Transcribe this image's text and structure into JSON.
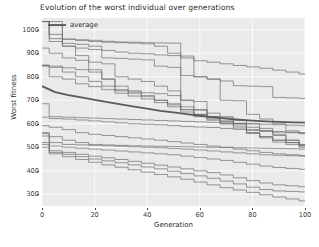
{
  "chart_data": {
    "type": "line",
    "title": "Evolution of the worst individual over generations",
    "xlabel": "Generation",
    "ylabel": "Worst fitness",
    "xlim": [
      0,
      100
    ],
    "ylim": [
      250,
      1050
    ],
    "xticks": [
      0,
      20,
      40,
      60,
      80,
      100
    ],
    "yticks": [
      300,
      400,
      500,
      600,
      700,
      800,
      900,
      1000
    ],
    "grid": true,
    "grid_color": "#ffffff",
    "plot_background": "#eaeaea",
    "legend": {
      "position": "upper left",
      "entries": [
        {
          "name": "average",
          "color": "#5a5a5a",
          "linewidth": 1.8
        }
      ]
    },
    "x": [
      0,
      5,
      10,
      15,
      20,
      25,
      30,
      35,
      40,
      45,
      50,
      55,
      60,
      65,
      70,
      75,
      80,
      85,
      90,
      95,
      100
    ],
    "series": [
      {
        "name": "run-1",
        "color": "#6d6d6d",
        "linewidth": 0.7,
        "values": [
          1035,
          1035,
          960,
          955,
          950,
          947,
          945,
          943,
          940,
          930,
          900,
          880,
          868,
          862,
          855,
          848,
          842,
          836,
          828,
          820,
          812
        ]
      },
      {
        "name": "run-2",
        "color": "#6d6d6d",
        "linewidth": 0.7,
        "values": [
          1035,
          1018,
          960,
          957,
          955,
          951,
          948,
          947,
          945,
          944,
          943,
          888,
          800,
          790,
          782,
          762,
          760,
          758,
          712,
          710,
          708
        ]
      },
      {
        "name": "run-3",
        "color": "#6d6d6d",
        "linewidth": 0.7,
        "values": [
          1035,
          962,
          930,
          922,
          916,
          912,
          905,
          900,
          898,
          893,
          890,
          805,
          800,
          790,
          700,
          698,
          640,
          620,
          600,
          570,
          560
        ]
      },
      {
        "name": "run-4",
        "color": "#6d6d6d",
        "linewidth": 0.7,
        "values": [
          1035,
          950,
          942,
          938,
          930,
          880,
          878,
          875,
          872,
          845,
          840,
          700,
          695,
          630,
          625,
          600,
          575,
          570,
          565,
          562,
          558
        ]
      },
      {
        "name": "run-5",
        "color": "#6d6d6d",
        "linewidth": 0.7,
        "values": [
          922,
          900,
          880,
          870,
          862,
          855,
          800,
          790,
          780,
          760,
          740,
          660,
          640,
          620,
          600,
          590,
          560,
          545,
          530,
          520,
          512
        ]
      },
      {
        "name": "run-6",
        "color": "#6d6d6d",
        "linewidth": 0.7,
        "values": [
          1035,
          980,
          930,
          890,
          830,
          790,
          740,
          735,
          732,
          728,
          720,
          700,
          660,
          630,
          612,
          600,
          560,
          545,
          530,
          520,
          510
        ]
      },
      {
        "name": "run-7",
        "color": "#6d6d6d",
        "linewidth": 0.7,
        "values": [
          850,
          845,
          838,
          830,
          820,
          790,
          760,
          740,
          720,
          700,
          680,
          660,
          640,
          625,
          610,
          600,
          585,
          570,
          550,
          530,
          508
        ]
      },
      {
        "name": "run-8",
        "color": "#6d6d6d",
        "linewidth": 0.7,
        "values": [
          848,
          840,
          820,
          800,
          780,
          760,
          745,
          730,
          715,
          700,
          685,
          672,
          658,
          645,
          630,
          615,
          600,
          580,
          555,
          530,
          505
        ]
      },
      {
        "name": "run-9",
        "color": "#6d6d6d",
        "linewidth": 0.7,
        "values": [
          845,
          800,
          790,
          770,
          758,
          745,
          730,
          718,
          705,
          690,
          672,
          650,
          630,
          615,
          600,
          582,
          562,
          540,
          522,
          512,
          500
        ]
      },
      {
        "name": "average",
        "color": "#5a5a5a",
        "linewidth": 1.8,
        "values": [
          760,
          735,
          722,
          712,
          702,
          692,
          682,
          673,
          664,
          655,
          648,
          641,
          634,
          628,
          622,
          617,
          613,
          610,
          608,
          606,
          605
        ]
      },
      {
        "name": "run-10",
        "color": "#6d6d6d",
        "linewidth": 0.7,
        "values": [
          685,
          630,
          628,
          626,
          624,
          622,
          620,
          618,
          616,
          614,
          612,
          610,
          608,
          606,
          604,
          602,
          600,
          598,
          596,
          594,
          592
        ]
      },
      {
        "name": "run-11",
        "color": "#6d6d6d",
        "linewidth": 0.7,
        "values": [
          628,
          622,
          620,
          616,
          612,
          608,
          604,
          600,
          598,
          596,
          592,
          588,
          586,
          584,
          580,
          576,
          572,
          568,
          566,
          564,
          562
        ]
      },
      {
        "name": "run-12",
        "color": "#6d6d6d",
        "linewidth": 0.7,
        "values": [
          592,
          585,
          575,
          562,
          555,
          550,
          545,
          540,
          535,
          530,
          524,
          518,
          512,
          505,
          500,
          492,
          485,
          478,
          472,
          468,
          465
        ]
      },
      {
        "name": "run-13",
        "color": "#6d6d6d",
        "linewidth": 0.7,
        "values": [
          562,
          545,
          530,
          520,
          512,
          510,
          508,
          506,
          505,
          504,
          503,
          502,
          501,
          500,
          499,
          498,
          497,
          496,
          495,
          494,
          492
        ]
      },
      {
        "name": "run-14",
        "color": "#6d6d6d",
        "linewidth": 0.7,
        "values": [
          558,
          520,
          512,
          510,
          508,
          506,
          504,
          502,
          500,
          498,
          495,
          492,
          488,
          484,
          480,
          476,
          472,
          468,
          466,
          464,
          462
        ]
      },
      {
        "name": "run-15",
        "color": "#6d6d6d",
        "linewidth": 0.7,
        "values": [
          548,
          505,
          500,
          496,
          492,
          488,
          484,
          480,
          476,
          472,
          468,
          462,
          456,
          450,
          444,
          436,
          428,
          420,
          414,
          410,
          406
        ]
      },
      {
        "name": "run-16",
        "color": "#6d6d6d",
        "linewidth": 0.7,
        "values": [
          520,
          485,
          478,
          470,
          462,
          455,
          448,
          440,
          432,
          424,
          416,
          408,
          400,
          392,
          382,
          370,
          358,
          348,
          340,
          336,
          332
        ]
      },
      {
        "name": "run-17",
        "color": "#6d6d6d",
        "linewidth": 0.7,
        "values": [
          512,
          478,
          470,
          460,
          450,
          442,
          434,
          425,
          416,
          408,
          398,
          388,
          378,
          368,
          356,
          344,
          330,
          320,
          314,
          312,
          310
        ]
      },
      {
        "name": "run-18",
        "color": "#6d6d6d",
        "linewidth": 0.7,
        "values": [
          500,
          472,
          460,
          448,
          436,
          425,
          415,
          404,
          394,
          384,
          374,
          364,
          352,
          340,
          328,
          318,
          308,
          298,
          288,
          280,
          272
        ]
      }
    ]
  }
}
